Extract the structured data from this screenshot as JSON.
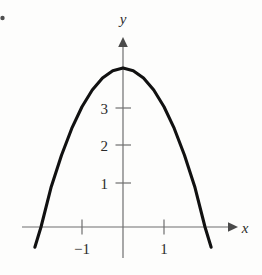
{
  "figure": {
    "kind": "cartesian-graph",
    "background_color": "#fdfdfc",
    "curve_color": "#111111",
    "axis_color": "#6f6f6f",
    "label_color": "#2b2b2b"
  },
  "axes": {
    "x_label": "x",
    "y_label": "y",
    "x_tick_labels": [
      "−1",
      "1"
    ],
    "y_tick_labels": [
      "1",
      "2",
      "3"
    ]
  },
  "chart_data": {
    "type": "line",
    "title": "",
    "subtitle": "",
    "xlabel": "x",
    "ylabel": "y",
    "xlim": [
      -2.45,
      2.75
    ],
    "ylim": [
      -0.75,
      4.9
    ],
    "grid": false,
    "legend": false,
    "legend_position": "none",
    "x_ticks": [
      -1,
      1
    ],
    "x_tick_labels": [
      "−1",
      "1"
    ],
    "y_ticks": [
      1,
      2,
      3
    ],
    "y_tick_labels": [
      "1",
      "2",
      "3"
    ],
    "annotations": [],
    "series": [
      {
        "name": "parabola",
        "equation": "y = 4 - x^2",
        "vertex": [
          0,
          4.1
        ],
        "x_intercepts": [
          -2.0,
          2.0
        ],
        "y_intercept": 4.1,
        "opens": "down",
        "x": [
          -2.15,
          -2.0,
          -1.75,
          -1.5,
          -1.25,
          -1.0,
          -0.75,
          -0.5,
          -0.25,
          0,
          0.25,
          0.5,
          0.75,
          1.0,
          1.25,
          1.5,
          1.75,
          2.0,
          2.15
        ],
        "y": [
          -0.52,
          0,
          1.04,
          1.85,
          2.54,
          3.1,
          3.53,
          3.84,
          4.03,
          4.1,
          4.03,
          3.84,
          3.53,
          3.1,
          2.54,
          1.85,
          1.04,
          0,
          -0.52
        ]
      }
    ]
  }
}
